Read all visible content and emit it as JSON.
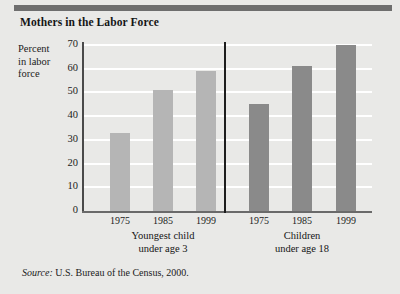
{
  "figure": {
    "title": "Mothers in the Labor Force",
    "source_lead": "Source:",
    "source_text": " U.S. Bureau of the Census, 2000.",
    "background_color": "#e9e9e7",
    "rule_color": "#6e6e6e"
  },
  "chart_data": {
    "type": "bar",
    "title": "Mothers in the Labor Force",
    "xlabel": "",
    "ylabel": "Percent in labor force",
    "ylabel_lines": [
      "Percent",
      "in labor",
      "force"
    ],
    "ylim": [
      0,
      70
    ],
    "yticks": [
      0,
      10,
      20,
      30,
      40,
      50,
      60,
      70
    ],
    "grid": true,
    "grid_color": "#ffffff",
    "legend": "none",
    "categories": [
      "1975",
      "1985",
      "1999"
    ],
    "groups": [
      {
        "name": "Youngest child under age 3",
        "caption_lines": [
          "Youngest child",
          "under age 3"
        ],
        "color": "#b5b5b5",
        "values": [
          33,
          51,
          59
        ]
      },
      {
        "name": "Children under age 18",
        "caption_lines": [
          "Children",
          "under age 18"
        ],
        "color": "#8a8a8a",
        "values": [
          45,
          61,
          70
        ]
      }
    ],
    "annotations": [
      "vertical divider separating the two groups"
    ],
    "source": "Source: U.S. Bureau of the Census, 2000."
  }
}
